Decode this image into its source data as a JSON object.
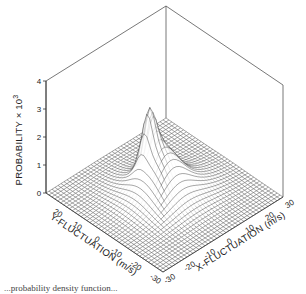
{
  "chart_data": {
    "type": "surface3d",
    "title": "",
    "xlabel": "X-FLUCTUATION (m/s)",
    "ylabel": "Y-FLUCTUATION (m/s)",
    "zlabel": "PROBABILITY × 10",
    "zlabel_exponent": "3",
    "x_ticks": [
      -30,
      -20,
      -10,
      0,
      10,
      20,
      30
    ],
    "y_ticks": [
      20,
      10,
      0,
      -10,
      -20,
      -30
    ],
    "z_ticks": [
      0,
      1,
      2,
      3,
      4
    ],
    "xlim": [
      -30,
      30
    ],
    "ylim": [
      -30,
      30
    ],
    "zlim": [
      0,
      4
    ],
    "grid_step": 1.5,
    "peak": {
      "x": -2,
      "y": 6,
      "z": 3.1
    },
    "components": [
      {
        "x": -2,
        "y": 6,
        "amp": 1.6,
        "sx": 2.5,
        "sy": 2.5
      },
      {
        "x": 0,
        "y": 2,
        "amp": 1.0,
        "sx": 6,
        "sy": 6
      },
      {
        "x": 4,
        "y": -2,
        "amp": 0.45,
        "sx": 10,
        "sy": 8
      },
      {
        "x": -4,
        "y": 4,
        "amp": 0.35,
        "sx": 9,
        "sy": 10
      }
    ],
    "line_color": "#3a3a3a",
    "box_color": "#555555"
  },
  "caption": "...probability density function..."
}
